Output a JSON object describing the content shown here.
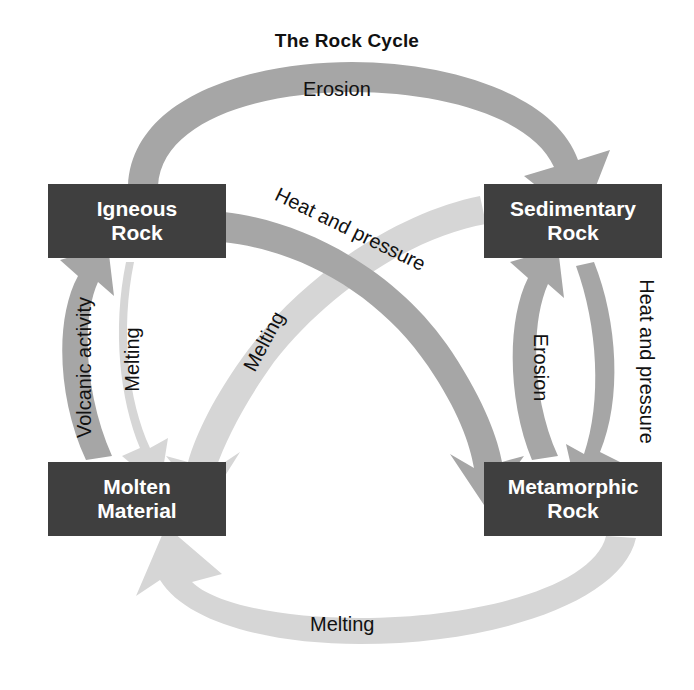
{
  "title": "The Rock Cycle",
  "palette": {
    "background": "#ffffff",
    "box_fill": "#3f3f3f",
    "box_text": "#ffffff",
    "arrow_dark": "#a6a6a6",
    "arrow_light": "#d6d6d6",
    "label_text": "#111111"
  },
  "nodes": [
    {
      "id": "igneous",
      "label": "Igneous\nRock",
      "position": "top-left"
    },
    {
      "id": "sedimentary",
      "label": "Sedimentary\nRock",
      "position": "top-right"
    },
    {
      "id": "molten",
      "label": "Molten\nMaterial",
      "position": "bottom-left"
    },
    {
      "id": "metamorphic",
      "label": "Metamorphic\nRock",
      "position": "bottom-right"
    }
  ],
  "arrows": [
    {
      "id": "erosion-top",
      "label": "Erosion",
      "from": "igneous",
      "to": "sedimentary",
      "tone": "dark"
    },
    {
      "id": "volcanic-activity",
      "label": "Volcanic activity",
      "from": "molten",
      "to": "igneous",
      "tone": "dark"
    },
    {
      "id": "melting-left",
      "label": "Melting",
      "from": "igneous",
      "to": "molten",
      "tone": "light"
    },
    {
      "id": "melting-center",
      "label": "Melting",
      "from": "sedimentary",
      "to": "molten",
      "tone": "light"
    },
    {
      "id": "heat-pressure-center",
      "label": "Heat and pressure",
      "from": "igneous",
      "to": "metamorphic",
      "tone": "dark"
    },
    {
      "id": "erosion-right",
      "label": "Erosion",
      "from": "metamorphic",
      "to": "sedimentary",
      "tone": "dark"
    },
    {
      "id": "heat-pressure-right",
      "label": "Heat and pressure",
      "from": "sedimentary",
      "to": "metamorphic",
      "tone": "dark"
    },
    {
      "id": "melting-bottom",
      "label": "Melting",
      "from": "metamorphic",
      "to": "molten",
      "tone": "light"
    }
  ]
}
